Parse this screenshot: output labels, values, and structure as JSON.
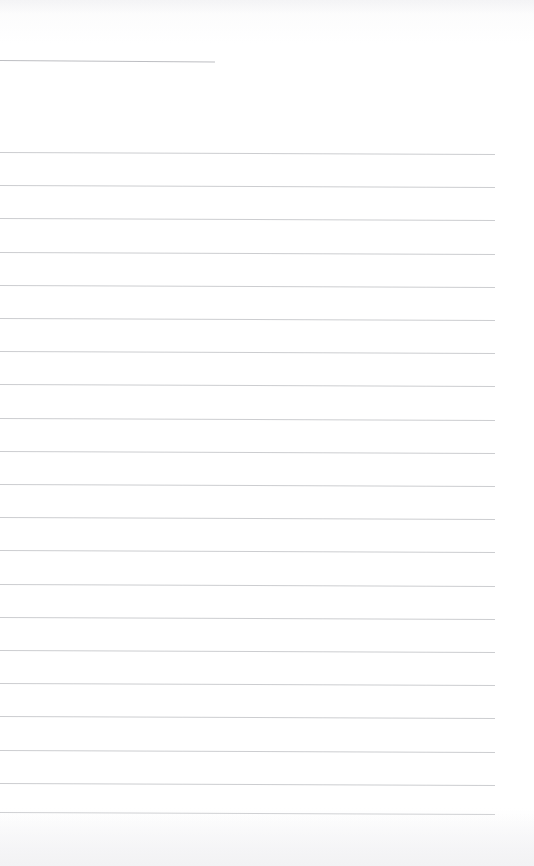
{
  "document": {
    "kind": "ruled-notebook-page",
    "title": "Blank Ruled Notebook Page",
    "page_width": 534,
    "page_height": 866,
    "background_color": "#ffffff",
    "rule_color": "#c9cace",
    "header_rule_color": "#b9babf",
    "text_content": "",
    "has_writing": false,
    "line_count": 22
  },
  "layout": {
    "left_margin_x": 0,
    "rule_right_edge_x": 495,
    "header_rule_right_edge_x": 215,
    "first_rule_y": 60,
    "body_first_rule_y": 152,
    "body_last_rule_y": 813,
    "rule_spacing": 33.2,
    "rule_slope_px": 2
  },
  "rules": [
    {
      "name": "header-rule",
      "y": 60,
      "x_start": 0,
      "x_end": 215,
      "slope": 1.5,
      "header": true
    },
    {
      "name": "rule-01",
      "y": 152,
      "x_start": 0,
      "x_end": 495,
      "slope": 2,
      "header": false
    },
    {
      "name": "rule-02",
      "y": 185.2,
      "x_start": 0,
      "x_end": 495,
      "slope": 2,
      "header": false
    },
    {
      "name": "rule-03",
      "y": 218.4,
      "x_start": 0,
      "x_end": 495,
      "slope": 2,
      "header": false
    },
    {
      "name": "rule-04",
      "y": 251.6,
      "x_start": 0,
      "x_end": 495,
      "slope": 2,
      "header": false
    },
    {
      "name": "rule-05",
      "y": 284.8,
      "x_start": 0,
      "x_end": 495,
      "slope": 2,
      "header": false
    },
    {
      "name": "rule-06",
      "y": 318.0,
      "x_start": 0,
      "x_end": 495,
      "slope": 2,
      "header": false
    },
    {
      "name": "rule-07",
      "y": 351.2,
      "x_start": 0,
      "x_end": 495,
      "slope": 2,
      "header": false
    },
    {
      "name": "rule-08",
      "y": 384.4,
      "x_start": 0,
      "x_end": 495,
      "slope": 2,
      "header": false
    },
    {
      "name": "rule-09",
      "y": 417.6,
      "x_start": 0,
      "x_end": 495,
      "slope": 2,
      "header": false
    },
    {
      "name": "rule-10",
      "y": 450.8,
      "x_start": 0,
      "x_end": 495,
      "slope": 2,
      "header": false
    },
    {
      "name": "rule-11",
      "y": 484.0,
      "x_start": 0,
      "x_end": 495,
      "slope": 2,
      "header": false
    },
    {
      "name": "rule-12",
      "y": 517.2,
      "x_start": 0,
      "x_end": 495,
      "slope": 2,
      "header": false
    },
    {
      "name": "rule-13",
      "y": 550.4,
      "x_start": 0,
      "x_end": 495,
      "slope": 2,
      "header": false
    },
    {
      "name": "rule-14",
      "y": 583.6,
      "x_start": 0,
      "x_end": 495,
      "slope": 2,
      "header": false
    },
    {
      "name": "rule-15",
      "y": 616.8,
      "x_start": 0,
      "x_end": 495,
      "slope": 2,
      "header": false
    },
    {
      "name": "rule-16",
      "y": 650.0,
      "x_start": 0,
      "x_end": 495,
      "slope": 2,
      "header": false
    },
    {
      "name": "rule-17",
      "y": 683.2,
      "x_start": 0,
      "x_end": 495,
      "slope": 2,
      "header": false
    },
    {
      "name": "rule-18",
      "y": 716.4,
      "x_start": 0,
      "x_end": 495,
      "slope": 2,
      "header": false
    },
    {
      "name": "rule-19",
      "y": 749.6,
      "x_start": 0,
      "x_end": 495,
      "slope": 2,
      "header": false
    },
    {
      "name": "rule-20",
      "y": 782.8,
      "x_start": 0,
      "x_end": 495,
      "slope": 2,
      "header": false
    },
    {
      "name": "rule-21",
      "y": 812.0,
      "x_start": 0,
      "x_end": 495,
      "slope": 2,
      "header": false
    }
  ]
}
